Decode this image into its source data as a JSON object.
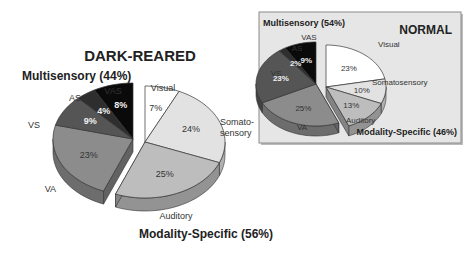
{
  "chart_data": [
    {
      "type": "pie",
      "title": "DARK-REARED",
      "groups": [
        {
          "name": "Multisensory",
          "label": "Multisensory (44%)",
          "total": 44
        },
        {
          "name": "Modality-Specific",
          "label": "Modality-Specific (56%)",
          "total": 56
        }
      ],
      "slices": [
        {
          "name": "Visual",
          "label": "Visual",
          "value": 7,
          "value_label": "7%",
          "group": "Modality-Specific",
          "color": "#ffffff"
        },
        {
          "name": "Somatosensory",
          "label": "Somato-\nsensory",
          "value": 24,
          "value_label": "24%",
          "group": "Modality-Specific",
          "color": "#e2e2e2"
        },
        {
          "name": "Auditory",
          "label": "Auditory",
          "value": 25,
          "value_label": "25%",
          "group": "Modality-Specific",
          "color": "#bdbdbd"
        },
        {
          "name": "VA",
          "label": "VA",
          "value": 23,
          "value_label": "23%",
          "group": "Multisensory",
          "color": "#8c8c8c"
        },
        {
          "name": "VS",
          "label": "VS",
          "value": 9,
          "value_label": "9%",
          "group": "Multisensory",
          "color": "#555555"
        },
        {
          "name": "AS",
          "label": "AS",
          "value": 4,
          "value_label": "4%",
          "group": "Multisensory",
          "color": "#2e2e2e"
        },
        {
          "name": "VAS",
          "label": "VAS",
          "value": 8,
          "value_label": "8%",
          "group": "Multisensory",
          "color": "#0a0a0a"
        }
      ]
    },
    {
      "type": "pie",
      "title": "NORMAL",
      "groups": [
        {
          "name": "Multisensory",
          "label": "Multisensory (54%)",
          "total": 54
        },
        {
          "name": "Modality-Specific",
          "label": "Modality-Specific (46%)",
          "total": 46
        }
      ],
      "slices": [
        {
          "name": "Visual",
          "label": "Visual",
          "value": 23,
          "value_label": "23%",
          "group": "Modality-Specific",
          "color": "#ffffff"
        },
        {
          "name": "Somatosensory",
          "label": "Somatosensory",
          "value": 10,
          "value_label": "10%",
          "group": "Modality-Specific",
          "color": "#e2e2e2"
        },
        {
          "name": "Auditory",
          "label": "Auditory",
          "value": 13,
          "value_label": "13%",
          "group": "Modality-Specific",
          "color": "#bdbdbd"
        },
        {
          "name": "VA",
          "label": "VA",
          "value": 25,
          "value_label": "25%",
          "group": "Multisensory",
          "color": "#8c8c8c"
        },
        {
          "name": "VS",
          "label": "VS",
          "value": 23,
          "value_label": "23%",
          "group": "Multisensory",
          "color": "#555555"
        },
        {
          "name": "AS",
          "label": "AS",
          "value": 2,
          "value_label": "2%",
          "group": "Multisensory",
          "color": "#2e2e2e"
        },
        {
          "name": "VAS",
          "label": "VAS",
          "value": 9,
          "value_label": "9%",
          "group": "Multisensory",
          "color": "#0a0a0a"
        }
      ]
    }
  ]
}
